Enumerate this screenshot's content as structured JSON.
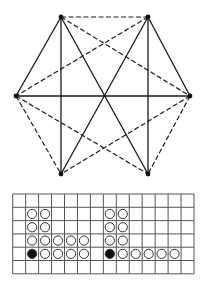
{
  "graph": {
    "vertices": [
      {
        "id": "TL",
        "x": 61,
        "y": 17
      },
      {
        "id": "TR",
        "x": 148,
        "y": 17
      },
      {
        "id": "L",
        "x": 16,
        "y": 96
      },
      {
        "id": "R",
        "x": 190,
        "y": 96
      },
      {
        "id": "BL",
        "x": 61,
        "y": 174
      },
      {
        "id": "BR",
        "x": 148,
        "y": 174
      }
    ],
    "edges": [
      {
        "a": "TL",
        "b": "TR",
        "style": "dashed"
      },
      {
        "a": "TL",
        "b": "L",
        "style": "solid"
      },
      {
        "a": "TL",
        "b": "BL",
        "style": "solid"
      },
      {
        "a": "TL",
        "b": "BR",
        "style": "solid"
      },
      {
        "a": "TL",
        "b": "R",
        "style": "dashed"
      },
      {
        "a": "TR",
        "b": "R",
        "style": "solid"
      },
      {
        "a": "TR",
        "b": "BR",
        "style": "solid"
      },
      {
        "a": "TR",
        "b": "BL",
        "style": "solid"
      },
      {
        "a": "TR",
        "b": "L",
        "style": "dashed"
      },
      {
        "a": "L",
        "b": "R",
        "style": "solid"
      },
      {
        "a": "L",
        "b": "BL",
        "style": "dashed"
      },
      {
        "a": "L",
        "b": "BR",
        "style": "dashed"
      },
      {
        "a": "R",
        "b": "BR",
        "style": "dashed"
      },
      {
        "a": "R",
        "b": "BL",
        "style": "dashed"
      }
    ],
    "colors": {
      "line": "#1a1a1a",
      "vertex": "#111111"
    }
  },
  "grid": {
    "left": 12.7,
    "top": 194,
    "cols": 14,
    "rows": 6,
    "cell_w": 12.95,
    "cell_h": 13.3,
    "line_color": "#555555",
    "pieces": [
      {
        "col": 1,
        "row": 1,
        "filled": false
      },
      {
        "col": 2,
        "row": 1,
        "filled": false
      },
      {
        "col": 1,
        "row": 2,
        "filled": false
      },
      {
        "col": 2,
        "row": 2,
        "filled": false
      },
      {
        "col": 1,
        "row": 3,
        "filled": false
      },
      {
        "col": 2,
        "row": 3,
        "filled": false
      },
      {
        "col": 3,
        "row": 3,
        "filled": false
      },
      {
        "col": 4,
        "row": 3,
        "filled": false
      },
      {
        "col": 5,
        "row": 3,
        "filled": false
      },
      {
        "col": 1,
        "row": 4,
        "filled": true
      },
      {
        "col": 2,
        "row": 4,
        "filled": false
      },
      {
        "col": 3,
        "row": 4,
        "filled": false
      },
      {
        "col": 4,
        "row": 4,
        "filled": false
      },
      {
        "col": 5,
        "row": 4,
        "filled": false
      },
      {
        "col": 7,
        "row": 1,
        "filled": false
      },
      {
        "col": 8,
        "row": 1,
        "filled": false
      },
      {
        "col": 7,
        "row": 2,
        "filled": false
      },
      {
        "col": 8,
        "row": 2,
        "filled": false
      },
      {
        "col": 7,
        "row": 3,
        "filled": false
      },
      {
        "col": 8,
        "row": 3,
        "filled": false
      },
      {
        "col": 7,
        "row": 4,
        "filled": true
      },
      {
        "col": 8,
        "row": 4,
        "filled": false
      },
      {
        "col": 9,
        "row": 4,
        "filled": false
      },
      {
        "col": 10,
        "row": 4,
        "filled": false
      },
      {
        "col": 11,
        "row": 4,
        "filled": false
      },
      {
        "col": 12,
        "row": 4,
        "filled": false
      }
    ],
    "piece_radius": 4.6,
    "piece_stroke": "#333333",
    "piece_fill_dark": "#111111"
  }
}
